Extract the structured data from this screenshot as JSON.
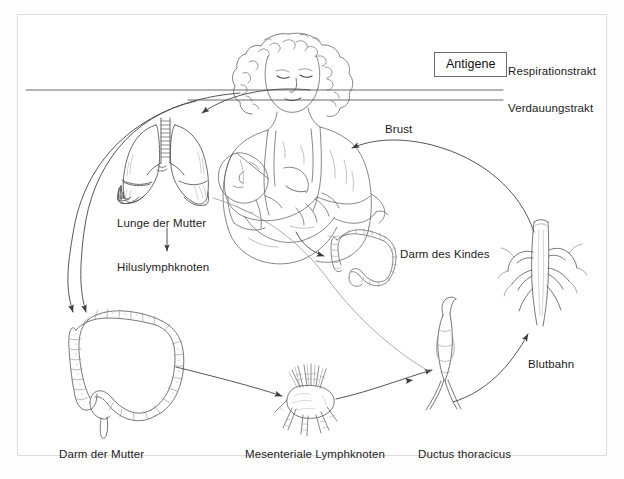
{
  "figure": {
    "title_alt": "Enteromammare und bronchomammare Zirkulation",
    "domain": "medical-illustration",
    "background_color": "#fdfdfd",
    "frame_color": "#dcdcdc",
    "ink_color": "#4a4a4a",
    "text_color": "#1d1d1d"
  },
  "callout": {
    "antigene_label": "Antigene"
  },
  "tract_labels": [
    {
      "id": "respirationstrakt",
      "text": "Respirationstrakt",
      "x": 508,
      "y": 66
    },
    {
      "id": "verdauungstrakt",
      "text": "Verdauungstrakt",
      "x": 508,
      "y": 103
    }
  ],
  "organ_labels": [
    {
      "id": "lunge-der-mutter",
      "text": "Lunge der Mutter",
      "x": 117,
      "y": 218
    },
    {
      "id": "hiluslymphknoten",
      "text": "Hiluslymphknoten",
      "x": 117,
      "y": 262
    },
    {
      "id": "brust",
      "text": "Brust",
      "x": 385,
      "y": 124
    },
    {
      "id": "darm-des-kindes",
      "text": "Darm des Kindes",
      "x": 400,
      "y": 249
    },
    {
      "id": "blutbahn",
      "text": "Blutbahn",
      "x": 528,
      "y": 359
    },
    {
      "id": "darm-der-mutter",
      "text": "Darm der Mutter",
      "x": 59,
      "y": 452
    },
    {
      "id": "mesenteriale-lymphknoten",
      "text": "Mesenteriale Lymphknoten",
      "x": 245,
      "y": 452
    },
    {
      "id": "ductus-thoracicus",
      "text": "Ductus thoracicus",
      "x": 418,
      "y": 452
    }
  ],
  "illustrations": [
    {
      "id": "mother-nursing-baby",
      "name": "mother-breastfeeding-baby-figure"
    },
    {
      "id": "maternal-lungs",
      "name": "lungs-illustration"
    },
    {
      "id": "maternal-colon",
      "name": "maternal-large-intestine-illustration"
    },
    {
      "id": "infant-colon",
      "name": "infant-large-intestine-illustration"
    },
    {
      "id": "lymph-node",
      "name": "mesenteric-lymph-node-illustration"
    },
    {
      "id": "thoracic-duct",
      "name": "thoracic-duct-illustration"
    },
    {
      "id": "blood-vessel",
      "name": "blood-vessel-illustration"
    }
  ],
  "flow_arrows": [
    {
      "id": "respiratory-to-lung",
      "from": "respirationstrakt",
      "to": "maternal-lungs"
    },
    {
      "id": "lung-to-hilar-node",
      "from": "lunge-der-mutter",
      "to": "hiluslymphknoten"
    },
    {
      "id": "lung-path-to-gut",
      "from": "respirationstrakt",
      "to": "darm-der-mutter"
    },
    {
      "id": "digestive-to-gut",
      "from": "verdauungstrakt",
      "to": "darm-der-mutter"
    },
    {
      "id": "gut-to-mesenteric-node",
      "from": "darm-der-mutter",
      "to": "mesenteriale-lymphknoten"
    },
    {
      "id": "node-to-thoracic-duct",
      "from": "mesenteriale-lymphknoten",
      "to": "ductus-thoracicus"
    },
    {
      "id": "duct-to-bloodstream",
      "from": "ductus-thoracicus",
      "to": "blutbahn"
    },
    {
      "id": "blood-to-breast",
      "from": "blutbahn",
      "to": "brust"
    },
    {
      "id": "breast-to-infant-gut",
      "from": "brust",
      "to": "darm-des-kindes"
    }
  ]
}
